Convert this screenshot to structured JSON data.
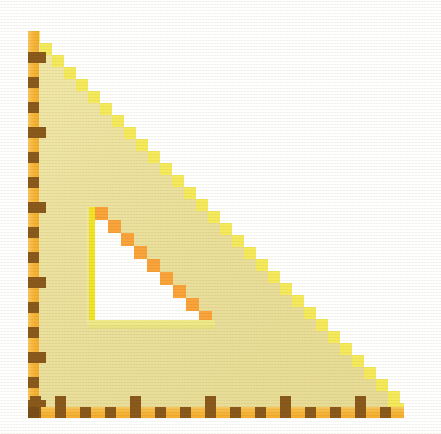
{
  "scene": {
    "title": "Pixel-art yellow set square ruler",
    "background_color": "#FFFFFF",
    "width": 441,
    "height": 434
  },
  "object": {
    "name": "set-square",
    "kind": "right-triangle-ruler",
    "orientation": "right angle at bottom-left",
    "bounds": {
      "left": 28,
      "top": 31,
      "right": 404,
      "bottom": 418
    },
    "right_angle_corner": {
      "x": 28,
      "y": 418
    },
    "apex_corner": {
      "x": 28,
      "y": 31
    },
    "far_corner": {
      "x": 404,
      "y": 418
    }
  },
  "colors": {
    "body_fill": "#EADF9B",
    "body_fill_light": "#F0E7A8",
    "hypotenuse_step": "#F5EA5C",
    "hypotenuse_step_alt": "#F7F06E",
    "ruler_strip": "#F6B437",
    "ruler_strip_light": "#F8C95E",
    "tick_mark": "#8A5A1C",
    "tick_mark_dark": "#7A4E18",
    "inner_edge_bright": "#F2E426",
    "inner_step_orange": "#F9A33A",
    "inner_step_orange_light": "#FBBE5E",
    "inner_cutout": "#FFFFFF",
    "inner_base_line": "#EFE98A",
    "background": "#FFFFFF"
  },
  "geometry": {
    "step_size_px": 12,
    "hypotenuse_steps": 31,
    "ruler_strip_width_px": 11,
    "inner_cutout": {
      "left": 93,
      "top": 209,
      "right": 215,
      "bottom": 322,
      "step_size_px": 13,
      "steps": 9
    }
  },
  "left_ruler": {
    "name": "left-edge-ruler",
    "axis": "vertical",
    "strip_x": 28,
    "strip_width": 11,
    "tick_interval_px": 25,
    "major_every": 2,
    "ticks": [
      {
        "y": 52,
        "size": "major"
      },
      {
        "y": 77,
        "size": "minor"
      },
      {
        "y": 102,
        "size": "minor"
      },
      {
        "y": 127,
        "size": "major"
      },
      {
        "y": 152,
        "size": "minor"
      },
      {
        "y": 177,
        "size": "minor"
      },
      {
        "y": 202,
        "size": "major"
      },
      {
        "y": 227,
        "size": "minor"
      },
      {
        "y": 252,
        "size": "minor"
      },
      {
        "y": 277,
        "size": "major"
      },
      {
        "y": 302,
        "size": "minor"
      },
      {
        "y": 327,
        "size": "minor"
      },
      {
        "y": 352,
        "size": "major"
      },
      {
        "y": 377,
        "size": "minor"
      },
      {
        "y": 400,
        "size": "major"
      }
    ]
  },
  "bottom_ruler": {
    "name": "bottom-edge-ruler",
    "axis": "horizontal",
    "strip_y": 407,
    "strip_height": 11,
    "tick_interval_px": 25,
    "major_every": 3,
    "ticks": [
      {
        "x": 30,
        "size": "major"
      },
      {
        "x": 55,
        "size": "major"
      },
      {
        "x": 80,
        "size": "minor"
      },
      {
        "x": 105,
        "size": "minor"
      },
      {
        "x": 130,
        "size": "major"
      },
      {
        "x": 155,
        "size": "minor"
      },
      {
        "x": 180,
        "size": "minor"
      },
      {
        "x": 205,
        "size": "major"
      },
      {
        "x": 230,
        "size": "minor"
      },
      {
        "x": 255,
        "size": "minor"
      },
      {
        "x": 280,
        "size": "major"
      },
      {
        "x": 305,
        "size": "minor"
      },
      {
        "x": 330,
        "size": "minor"
      },
      {
        "x": 355,
        "size": "major"
      },
      {
        "x": 380,
        "size": "minor"
      }
    ]
  },
  "labels": {
    "object_label": "set square",
    "left_ruler_label": "vertical scale",
    "bottom_ruler_label": "horizontal scale",
    "cutout_label": "inner triangular cutout"
  }
}
